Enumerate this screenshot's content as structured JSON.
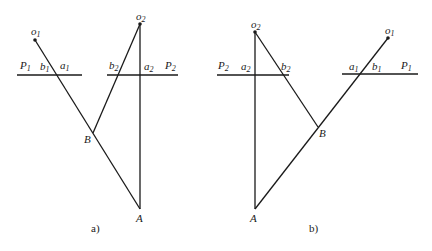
{
  "figure_a": {
    "caption": "a)",
    "labels": {
      "o1": {
        "main": "o",
        "sub": "1"
      },
      "o2": {
        "main": "o",
        "sub": "2"
      },
      "P1": {
        "main": "P",
        "sub": "1"
      },
      "P2": {
        "main": "P",
        "sub": "2"
      },
      "a1": {
        "main": "a",
        "sub": "1"
      },
      "b1": {
        "main": "b",
        "sub": "1"
      },
      "a2": {
        "main": "a",
        "sub": "2"
      },
      "b2": {
        "main": "b",
        "sub": "2"
      },
      "B": "B",
      "A": "A"
    }
  },
  "figure_b": {
    "caption": "b)",
    "labels": {
      "o1": {
        "main": "o",
        "sub": "1"
      },
      "o2": {
        "main": "o",
        "sub": "2"
      },
      "P1": {
        "main": "P",
        "sub": "1"
      },
      "P2": {
        "main": "P",
        "sub": "2"
      },
      "a1": {
        "main": "a",
        "sub": "1"
      },
      "b1": {
        "main": "b",
        "sub": "1"
      },
      "a2": {
        "main": "a",
        "sub": "2"
      },
      "b2": {
        "main": "b",
        "sub": "2"
      },
      "B": "B",
      "A": "A"
    }
  },
  "colors": {
    "line": "#1a1a1a",
    "background": "#ffffff"
  }
}
